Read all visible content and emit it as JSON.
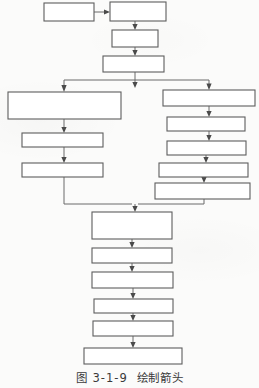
{
  "figure": {
    "caption_label": "图",
    "caption_number": "3-1-9",
    "caption_title": "绘制箭头",
    "caption_full": "图 3-1-9  绘制箭头",
    "diagram_type": "flowchart",
    "box_fill_color": "#ffffff",
    "box_stroke_color": "#5d5d5d",
    "connector_color": "#6a6a6a",
    "page_background": "#fbfbfa"
  },
  "nodes": {
    "top": [
      {
        "id": "n1",
        "label": "",
        "x": 44,
        "y": 3,
        "w": 50,
        "h": 18
      },
      {
        "id": "n2",
        "label": "",
        "x": 110,
        "y": 2,
        "w": 56,
        "h": 19
      },
      {
        "id": "n3",
        "label": "",
        "x": 112,
        "y": 30,
        "w": 46,
        "h": 17
      },
      {
        "id": "n4",
        "label": "",
        "x": 103,
        "y": 56,
        "w": 61,
        "h": 16
      }
    ],
    "left_branch": [
      {
        "id": "l1",
        "label": "",
        "x": 8,
        "y": 92,
        "w": 113,
        "h": 27
      },
      {
        "id": "l2",
        "label": "",
        "x": 22,
        "y": 133,
        "w": 81,
        "h": 14
      },
      {
        "id": "l3",
        "label": "",
        "x": 22,
        "y": 163,
        "w": 81,
        "h": 14
      }
    ],
    "right_branch": [
      {
        "id": "r1",
        "label": "",
        "x": 163,
        "y": 90,
        "w": 92,
        "h": 16
      },
      {
        "id": "r2",
        "label": "",
        "x": 167,
        "y": 117,
        "w": 78,
        "h": 14
      },
      {
        "id": "r3",
        "label": "",
        "x": 167,
        "y": 141,
        "w": 79,
        "h": 14
      },
      {
        "id": "r4",
        "label": "",
        "x": 159,
        "y": 163,
        "w": 89,
        "h": 14
      },
      {
        "id": "r5",
        "label": "",
        "x": 155,
        "y": 183,
        "w": 95,
        "h": 16
      }
    ],
    "bottom_chain": [
      {
        "id": "b1",
        "label": "",
        "x": 92,
        "y": 212,
        "w": 80,
        "h": 27
      },
      {
        "id": "b2",
        "label": "",
        "x": 92,
        "y": 248,
        "w": 80,
        "h": 15
      },
      {
        "id": "b3",
        "label": "",
        "x": 92,
        "y": 272,
        "w": 81,
        "h": 16
      },
      {
        "id": "b4",
        "label": "",
        "x": 94,
        "y": 299,
        "w": 79,
        "h": 14
      },
      {
        "id": "b5",
        "label": "",
        "x": 93,
        "y": 321,
        "w": 80,
        "h": 15
      },
      {
        "id": "b6",
        "label": "",
        "x": 84,
        "y": 348,
        "w": 98,
        "h": 16
      }
    ]
  },
  "edges": [
    {
      "from": "n1",
      "to": "n2",
      "kind": "horizontal-arrow"
    },
    {
      "from": "n2",
      "to": "n3",
      "kind": "vertical-arrow"
    },
    {
      "from": "n3",
      "to": "n4",
      "kind": "vertical-arrow"
    },
    {
      "from": "n4",
      "to": "split",
      "kind": "vertical-arrow"
    },
    {
      "from": "split",
      "to": "l1",
      "kind": "branch-left-arrow"
    },
    {
      "from": "split",
      "to": "r1",
      "kind": "branch-right-arrow"
    },
    {
      "from": "l1",
      "to": "l2",
      "kind": "vertical-arrow"
    },
    {
      "from": "l2",
      "to": "l3",
      "kind": "vertical-arrow"
    },
    {
      "from": "r1",
      "to": "r2",
      "kind": "vertical-arrow"
    },
    {
      "from": "r2",
      "to": "r3",
      "kind": "vertical-arrow"
    },
    {
      "from": "r3",
      "to": "r4",
      "kind": "vertical-arrow"
    },
    {
      "from": "r4",
      "to": "r5",
      "kind": "vertical-arrow"
    },
    {
      "from": "l3",
      "to": "merge",
      "kind": "elbow-down"
    },
    {
      "from": "r5",
      "to": "merge",
      "kind": "elbow-down"
    },
    {
      "from": "merge",
      "to": "b1",
      "kind": "vertical-arrow"
    },
    {
      "from": "b1",
      "to": "b2",
      "kind": "vertical-arrow"
    },
    {
      "from": "b2",
      "to": "b3",
      "kind": "vertical-arrow"
    },
    {
      "from": "b3",
      "to": "b4",
      "kind": "vertical-arrow"
    },
    {
      "from": "b4",
      "to": "b5",
      "kind": "vertical-arrow"
    },
    {
      "from": "b5",
      "to": "b6",
      "kind": "vertical-arrow"
    }
  ]
}
